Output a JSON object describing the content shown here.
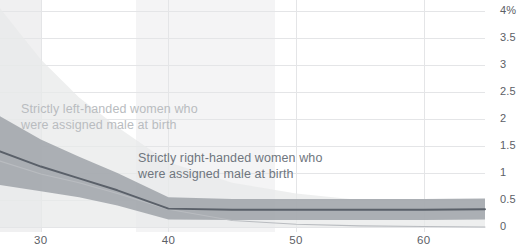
{
  "chart_data": {
    "type": "line",
    "title": "",
    "subtitle": "",
    "xlabel": "",
    "ylabel": "",
    "xlim": [
      26.8,
      64.8
    ],
    "ylim": [
      -0.1,
      4.07
    ],
    "grid": true,
    "legend_position": "inline-annotation",
    "y_ticks": [
      {
        "value": 4,
        "label": "4%"
      },
      {
        "value": 3.5,
        "label": "3.5"
      },
      {
        "value": 3,
        "label": "3"
      },
      {
        "value": 2.5,
        "label": "2.5"
      },
      {
        "value": 2,
        "label": "2"
      },
      {
        "value": 1.5,
        "label": "1.5"
      },
      {
        "value": 1,
        "label": "1"
      },
      {
        "value": 0.5,
        "label": "0.5"
      },
      {
        "value": 0,
        "label": "0"
      }
    ],
    "x_ticks": [
      {
        "value": 30,
        "label": "30"
      },
      {
        "value": 40,
        "label": "40"
      },
      {
        "value": 50,
        "label": "50"
      },
      {
        "value": 60,
        "label": "60"
      }
    ],
    "series": [
      {
        "name": "Strictly left-handed women who were assigned male at birth",
        "color": "#b9bcc0",
        "band_color": "#e8e9ea",
        "x": [
          26.8,
          30,
          33,
          36,
          40,
          45,
          50,
          55,
          60,
          64.8
        ],
        "values": [
          1.22,
          0.98,
          0.82,
          0.62,
          0.33,
          0.12,
          0.05,
          0.02,
          0.01,
          0.0
        ],
        "band_upper": [
          4.05,
          3.1,
          2.4,
          1.85,
          1.2,
          0.82,
          0.62,
          0.5,
          0.42,
          0.38
        ],
        "band_lower": [
          0.0,
          0.0,
          0.0,
          0.0,
          0.0,
          0.0,
          0.0,
          0.0,
          0.0,
          0.0
        ]
      },
      {
        "name": "Strictly right-handed women who were assigned male at birth",
        "color": "#5a6069",
        "band_color": "#a7abb0",
        "x": [
          26.8,
          30,
          33,
          36,
          40,
          45,
          50,
          55,
          60,
          64.8
        ],
        "values": [
          1.4,
          1.12,
          0.9,
          0.68,
          0.34,
          0.32,
          0.32,
          0.32,
          0.32,
          0.33
        ],
        "band_upper": [
          2.05,
          1.62,
          1.3,
          1.0,
          0.55,
          0.52,
          0.52,
          0.52,
          0.52,
          0.53
        ],
        "band_lower": [
          0.78,
          0.66,
          0.55,
          0.4,
          0.14,
          0.13,
          0.13,
          0.13,
          0.13,
          0.14
        ]
      }
    ],
    "annotations": [
      {
        "id": "left-handed-label",
        "line1": "Strictly left-handed women who",
        "line2": "were assigned male at birth",
        "color": "#b9bcc0",
        "x_px": 21,
        "y_px": 101
      },
      {
        "id": "right-handed-label",
        "line1": "Strictly right-handed women who",
        "line2": "were assigned male at birth",
        "color": "#6f767e",
        "x_px": 138,
        "y_px": 150
      }
    ],
    "shaded_columns": [
      {
        "x_start_px": 0,
        "x_end_px": 42,
        "color": "#f0f0f1"
      },
      {
        "x_start_px": 136,
        "x_end_px": 275,
        "color": "#f4f4f5"
      }
    ],
    "colors": {
      "gridline": "#e4e5e7",
      "axis_text": "#5c6066",
      "background": "#ffffff"
    }
  }
}
